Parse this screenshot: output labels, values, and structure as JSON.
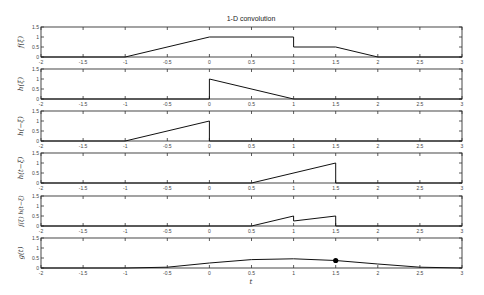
{
  "chart_data": {
    "type": "line",
    "title": "1-D convolution",
    "xlabel": "t",
    "xlim": [
      -2,
      3
    ],
    "ylim": [
      0,
      1.5
    ],
    "x_ticks": [
      "-2",
      "-1.5",
      "-1",
      "-0.5",
      "0",
      "0.5",
      "1",
      "1.5",
      "2",
      "2.5",
      "3"
    ],
    "x_tick_values": [
      -2,
      -1.5,
      -1,
      -0.5,
      0,
      0.5,
      1,
      1.5,
      2,
      2.5,
      3
    ],
    "y_ticks": [
      "0",
      "0.5",
      "1",
      "1.5"
    ],
    "y_tick_values": [
      0,
      0.5,
      1,
      1.5
    ],
    "grid": false,
    "t_current": 1.5,
    "panels": [
      {
        "name": "f",
        "ylabel": "f(ξ)",
        "points": [
          [
            -2,
            0
          ],
          [
            -1,
            0
          ],
          [
            0,
            1
          ],
          [
            1,
            1
          ],
          [
            1,
            0.5
          ],
          [
            1.5,
            0.5
          ],
          [
            2,
            0
          ],
          [
            3,
            0
          ]
        ]
      },
      {
        "name": "h",
        "ylabel": "h(ξ)",
        "points": [
          [
            -2,
            0
          ],
          [
            0,
            0
          ],
          [
            0,
            1
          ],
          [
            1,
            0
          ],
          [
            3,
            0
          ]
        ]
      },
      {
        "name": "h_flipped",
        "ylabel": "h(−ξ)",
        "points": [
          [
            -2,
            0
          ],
          [
            -1,
            0
          ],
          [
            0,
            1
          ],
          [
            0,
            0
          ],
          [
            3,
            0
          ]
        ]
      },
      {
        "name": "h_shifted",
        "ylabel": "h(t−ξ)",
        "points": [
          [
            -2,
            0
          ],
          [
            0.5,
            0
          ],
          [
            1.5,
            1
          ],
          [
            1.5,
            0
          ],
          [
            3,
            0
          ]
        ]
      },
      {
        "name": "product",
        "ylabel": "f(ξ) h(t−ξ)",
        "points": [
          [
            -2,
            0
          ],
          [
            0.5,
            0
          ],
          [
            1,
            0.5
          ],
          [
            1,
            0.25
          ],
          [
            1.5,
            0.5
          ],
          [
            1.5,
            0
          ],
          [
            3,
            0
          ]
        ]
      },
      {
        "name": "g",
        "ylabel": "g(t)",
        "points": [
          [
            -2,
            0
          ],
          [
            -1,
            0
          ],
          [
            -0.5,
            0.04
          ],
          [
            0,
            0.25
          ],
          [
            0.5,
            0.42
          ],
          [
            1,
            0.46
          ],
          [
            1.5,
            0.375
          ],
          [
            2,
            0.2
          ],
          [
            2.5,
            0.04
          ],
          [
            3,
            0
          ]
        ],
        "marker": {
          "x": 1.5,
          "y": 0.375
        }
      }
    ]
  },
  "colors": {
    "axis": "#333333",
    "line": "#111111",
    "marker": "#000000",
    "background": "#ffffff"
  }
}
